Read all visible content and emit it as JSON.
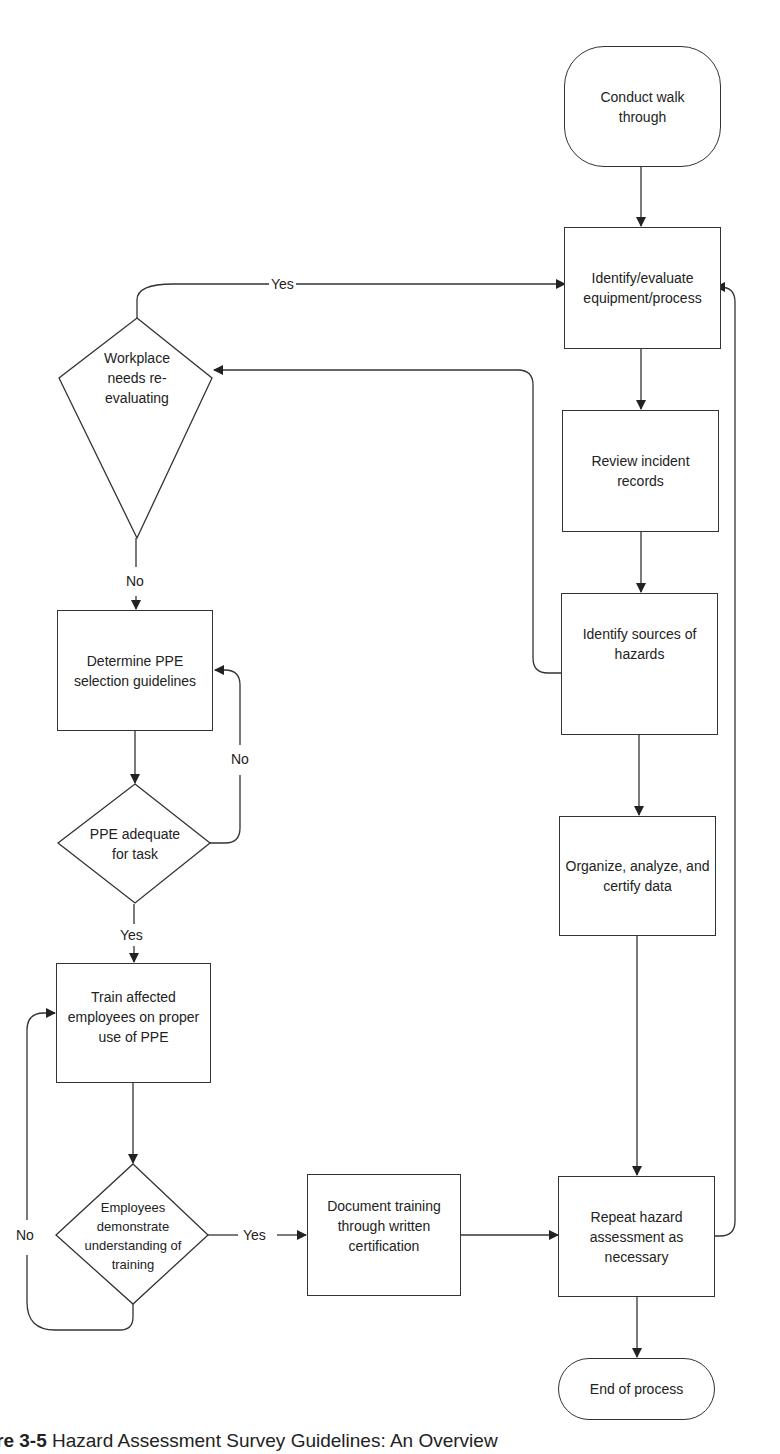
{
  "nodes": {
    "start": "Conduct walk through",
    "identify_evaluate": "Identify/evaluate equipment/process",
    "review_records": "Review incident records",
    "identify_sources": "Identify sources of hazards",
    "organize_data": "Organize, analyze, and certify data",
    "repeat_assessment": "Repeat hazard assessment as necessary",
    "end": "End of process",
    "workplace_decision": "Workplace needs re-evaluating",
    "determine_ppe": "Determine PPE selection guidelines",
    "ppe_adequate_decision": "PPE adequate for task",
    "train_employees": "Train affected employees on proper use of PPE",
    "employees_understand_decision": "Employees demonstrate understanding of training",
    "document_training": "Document training through written certification"
  },
  "edge_labels": {
    "workplace_yes": "Yes",
    "workplace_no": "No",
    "ppe_no": "No",
    "ppe_yes": "Yes",
    "understand_yes": "Yes",
    "understand_no": "No"
  },
  "caption": {
    "figure_prefix": "re 3-5",
    "title": "Hazard Assessment Survey Guidelines: An Overview"
  },
  "colors": {
    "line": "#333333",
    "background": "#ffffff",
    "text": "#222222"
  }
}
